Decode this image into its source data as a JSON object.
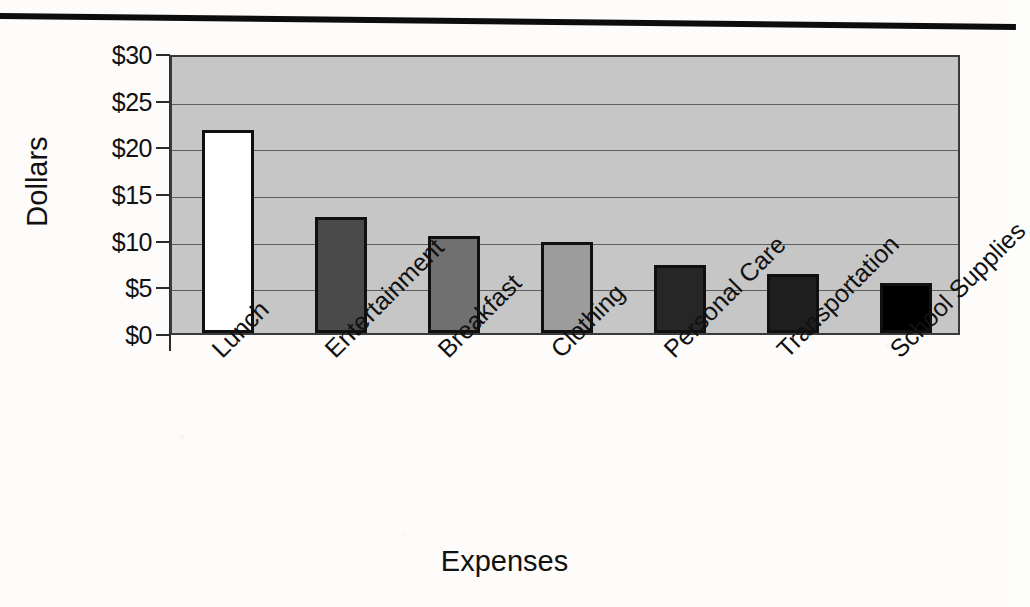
{
  "chart_data": {
    "type": "bar",
    "title": "",
    "xlabel": "Expenses",
    "ylabel": "Dollars",
    "categories": [
      "Lunch",
      "Entertainment",
      "Breakfast",
      "Clothing",
      "Personal Care",
      "Transportation",
      "School Supplies"
    ],
    "values": [
      21.7,
      12.4,
      10.4,
      9.7,
      7.3,
      6.3,
      5.4
    ],
    "bar_colors": [
      "#ffffff",
      "#4a4a4a",
      "#707070",
      "#9c9c9c",
      "#262626",
      "#1e1e1e",
      "#000000"
    ],
    "ylim": [
      0,
      30
    ],
    "ytick_values": [
      0,
      5,
      10,
      15,
      20,
      25,
      30
    ],
    "ytick_labels": [
      "$0",
      "$5",
      "$10",
      "$15",
      "$20",
      "$25",
      "$30"
    ],
    "grid": true,
    "legend": "none",
    "plot_background": "#c6c6c6",
    "bar_outline_color": "#101010"
  },
  "axis": {
    "y_title": "Dollars",
    "x_title": "Expenses"
  }
}
